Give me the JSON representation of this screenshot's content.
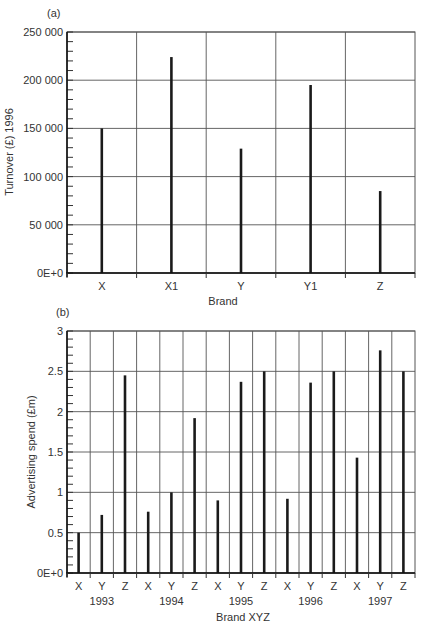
{
  "chart_data": [
    {
      "type": "bar",
      "panel_label": "(a)",
      "title": "",
      "xlabel": "Brand",
      "ylabel": "Turnover (£) 1996",
      "ylim": [
        0,
        250000
      ],
      "yticks": [
        0,
        50000,
        100000,
        150000,
        200000,
        250000
      ],
      "ytick_labels": [
        "0E+0",
        "50 000",
        "100 000",
        "150 000",
        "200 000",
        "250 000"
      ],
      "grid": true,
      "categories": [
        "X",
        "X1",
        "Y",
        "Y1",
        "Z"
      ],
      "values": [
        150000,
        224000,
        129000,
        195000,
        85000
      ]
    },
    {
      "type": "bar",
      "panel_label": "(b)",
      "title": "",
      "xlabel": "Brand XYZ",
      "ylabel": "Advertising spend (£m)",
      "ylim": [
        0,
        3
      ],
      "yticks": [
        0,
        0.5,
        1,
        1.5,
        2,
        2.5,
        3
      ],
      "ytick_labels": [
        "0E+0",
        "0.5",
        "1",
        "1.5",
        "2",
        "2.5",
        "3"
      ],
      "grid": true,
      "groups": [
        "1993",
        "1994",
        "1995",
        "1996",
        "1997"
      ],
      "categories": [
        "X",
        "Y",
        "Z",
        "X",
        "Y",
        "Z",
        "X",
        "Y",
        "Z",
        "X",
        "Y",
        "Z",
        "X",
        "Y",
        "Z"
      ],
      "series": [
        {
          "name": "X",
          "values": [
            0.5,
            0.76,
            0.9,
            0.92,
            1.43
          ]
        },
        {
          "name": "Y",
          "values": [
            0.72,
            1.0,
            2.37,
            2.36,
            2.76
          ]
        },
        {
          "name": "Z",
          "values": [
            2.45,
            1.92,
            2.5,
            2.5,
            2.5
          ]
        }
      ],
      "values": [
        0.5,
        0.72,
        2.45,
        0.76,
        1.0,
        1.92,
        0.9,
        2.37,
        2.5,
        0.92,
        2.36,
        2.5,
        1.43,
        2.76,
        2.5
      ]
    }
  ],
  "layout": {
    "panels": [
      {
        "left": 67,
        "right": 415,
        "top": 32,
        "bottom": 273,
        "minor_per_major": 5
      },
      {
        "left": 67,
        "right": 415,
        "top": 331,
        "bottom": 573,
        "minor_per_major": 5
      }
    ]
  }
}
